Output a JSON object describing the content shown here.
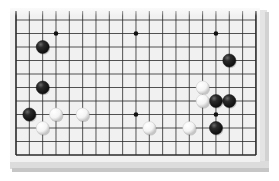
{
  "board": {
    "description": "Partial Go board diagram (lower side, 19 columns x 11 visible rows)",
    "columns": 19,
    "visible_rows": 11,
    "origin_x": 16,
    "origin_y": 20,
    "cell_w": 13.33,
    "cell_h": 13.5,
    "colors": {
      "surface": "#f1f1f1",
      "line": "#2a2a2a",
      "bevel_right": "#e2e2e2",
      "bevel_bottom": "#d8d8d8",
      "black_stone": "#1c1c1c",
      "white_stone": "#fafafa"
    },
    "star_points": [
      {
        "col": 3,
        "row": 1
      },
      {
        "col": 9,
        "row": 1
      },
      {
        "col": 15,
        "row": 1
      },
      {
        "col": 9,
        "row": 7
      },
      {
        "col": 15,
        "row": 7
      }
    ],
    "stones": [
      {
        "color": "black",
        "col": 2,
        "row": 2
      },
      {
        "color": "black",
        "col": 2,
        "row": 5
      },
      {
        "color": "black",
        "col": 1,
        "row": 7
      },
      {
        "color": "black",
        "col": 16,
        "row": 3
      },
      {
        "color": "black",
        "col": 15,
        "row": 6
      },
      {
        "color": "black",
        "col": 16,
        "row": 6
      },
      {
        "color": "black",
        "col": 15,
        "row": 8
      },
      {
        "color": "white",
        "col": 3,
        "row": 7
      },
      {
        "color": "white",
        "col": 2,
        "row": 8
      },
      {
        "color": "white",
        "col": 5,
        "row": 7
      },
      {
        "color": "white",
        "col": 14,
        "row": 5
      },
      {
        "color": "white",
        "col": 14,
        "row": 6
      },
      {
        "color": "white",
        "col": 10,
        "row": 8
      },
      {
        "color": "white",
        "col": 13,
        "row": 8
      }
    ]
  }
}
